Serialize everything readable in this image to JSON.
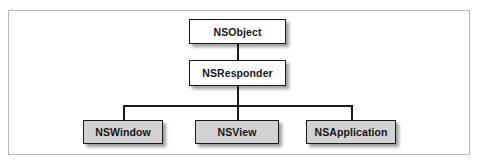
{
  "diagram": {
    "type": "class-hierarchy",
    "title": "",
    "frame": {
      "border_color": "#b9b9b9",
      "background": "#ffffff"
    },
    "colors": {
      "box_border": "#1b1b1b",
      "root_fill": "#ffffff",
      "leaf_fill": "#d2d2d2",
      "connector": "#1b1b1b",
      "text": "#141414"
    },
    "nodes": {
      "root": {
        "label": "NSObject",
        "fill": "white",
        "level": 0
      },
      "responder": {
        "label": "NSResponder",
        "fill": "white",
        "level": 1
      },
      "window": {
        "label": "NSWindow",
        "fill": "gray",
        "level": 2
      },
      "view": {
        "label": "NSView",
        "fill": "gray",
        "level": 2
      },
      "application": {
        "label": "NSApplication",
        "fill": "gray",
        "level": 2
      }
    },
    "edges": [
      {
        "from": "NSObject",
        "to": "NSResponder"
      },
      {
        "from": "NSResponder",
        "to": "NSWindow"
      },
      {
        "from": "NSResponder",
        "to": "NSView"
      },
      {
        "from": "NSResponder",
        "to": "NSApplication"
      }
    ]
  }
}
